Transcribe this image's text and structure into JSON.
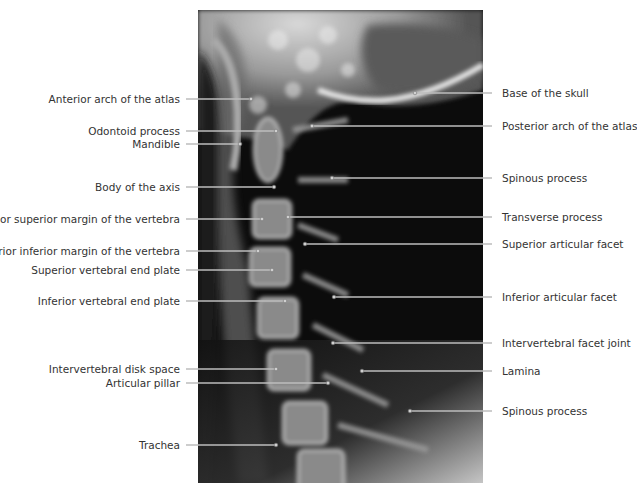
{
  "figure": {
    "type": "Lateral cervical spine radiograph with labels",
    "colors": {
      "text": "#333333",
      "leader": "#bdbdbd",
      "background": "#ffffff"
    },
    "left_labels": [
      {
        "text": "Anterior arch of the atlas",
        "y": 99,
        "end_x": 251
      },
      {
        "text": "Odontoid process",
        "y": 131,
        "end_x": 276
      },
      {
        "text": "Mandible",
        "y": 144,
        "end_x": 240
      },
      {
        "text": "Body of the axis",
        "y": 187,
        "end_x": 274
      },
      {
        "text": "Anterior superior margin of the vertebra",
        "y": 219,
        "end_x": 262
      },
      {
        "text": "Anterior inferior margin of the vertebra",
        "y": 251,
        "end_x": 258
      },
      {
        "text": "Superior vertebral end plate",
        "y": 270,
        "end_x": 272
      },
      {
        "text": "Inferior vertebral end plate",
        "y": 301,
        "end_x": 285
      },
      {
        "text": "Intervertebral disk space",
        "y": 369,
        "end_x": 276
      },
      {
        "text": "Articular pillar",
        "y": 383,
        "end_x": 328
      },
      {
        "text": "Trachea",
        "y": 445,
        "end_x": 276
      }
    ],
    "right_labels": [
      {
        "text": "Base of the skull",
        "y": 93,
        "start_x": 415
      },
      {
        "text": "Posterior arch of the atlas",
        "y": 126,
        "start_x": 312
      },
      {
        "text": "Spinous process",
        "y": 178,
        "start_x": 332
      },
      {
        "text": "Transverse process",
        "y": 217,
        "start_x": 288
      },
      {
        "text": "Superior articular facet",
        "y": 244,
        "start_x": 305
      },
      {
        "text": "Inferior articular facet",
        "y": 297,
        "start_x": 334
      },
      {
        "text": "Intervertebral facet joint",
        "y": 343,
        "start_x": 333
      },
      {
        "text": "Lamina",
        "y": 371,
        "start_x": 362
      },
      {
        "text": "Spinous process",
        "y": 411,
        "start_x": 410
      }
    ]
  }
}
